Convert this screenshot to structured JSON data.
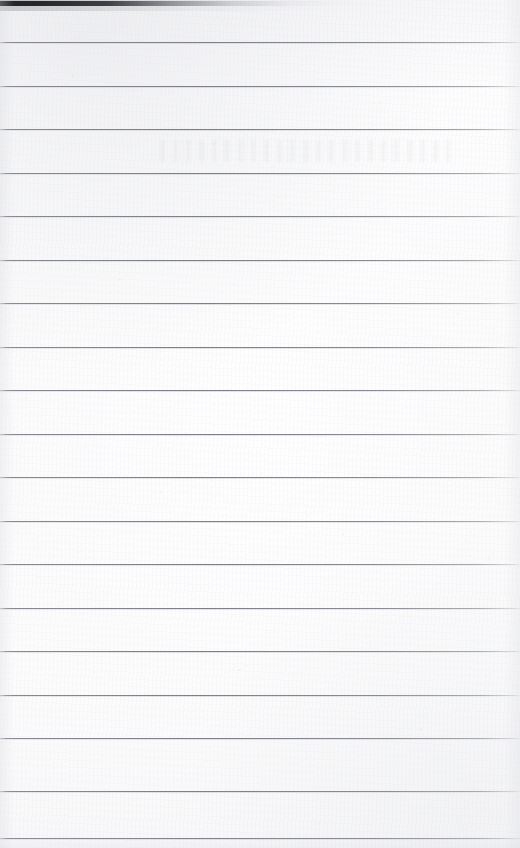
{
  "document": {
    "kind": "scanned-blank-ruled-notebook-page",
    "page_width": 520,
    "page_height": 848,
    "visible_text": "",
    "text_content_note": "no legible handwriting, printing, page number, header or footer is visible on this sheet",
    "paper_color": "#fbfbfc",
    "rule_color": "#7e8087",
    "rule_thickness_px": 1,
    "rule_pitch_px": 43.5,
    "first_rule_y": 42,
    "rule_count": 19,
    "rules_y": [
      42,
      85.5,
      129,
      172.5,
      216,
      259.5,
      303,
      346.5,
      390,
      433.5,
      477,
      520.5,
      564,
      607.5,
      651,
      694.5,
      738,
      791,
      838
    ],
    "rules_span_full_width": true,
    "right_edge_fade": true
  },
  "scan_artifacts": {
    "top_shadow_band": {
      "name": "scanner-edge-shadow",
      "color": "#18181b",
      "top_y": 1,
      "height_px": 5,
      "darkest_from_x": 0,
      "darkest_to_x": 110,
      "fades_out_by_x": 390
    },
    "bleed_through": {
      "name": "reverse-side-bleed-through",
      "y": 140,
      "height_px": 22,
      "left_x": 160,
      "width_px": 290,
      "legible": false
    },
    "grain": "fibrous paper grain",
    "speckle": "scattered dust specks",
    "vignette": "soft gray edge vignette on left, right and bottom margins"
  }
}
